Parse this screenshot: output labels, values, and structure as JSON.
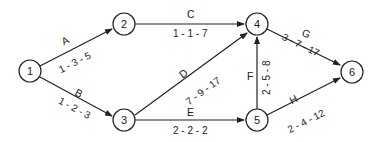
{
  "diagram": {
    "type": "PERT activity-on-arrow network",
    "nodes": [
      {
        "id": "1",
        "label": "1",
        "x": 30,
        "y": 71
      },
      {
        "id": "2",
        "label": "2",
        "x": 124,
        "y": 24
      },
      {
        "id": "3",
        "label": "3",
        "x": 124,
        "y": 120
      },
      {
        "id": "4",
        "label": "4",
        "x": 257,
        "y": 24
      },
      {
        "id": "5",
        "label": "5",
        "x": 257,
        "y": 120
      },
      {
        "id": "6",
        "label": "6",
        "x": 352,
        "y": 72
      }
    ],
    "edges": [
      {
        "from": "1",
        "to": "2",
        "activity": "A",
        "estimate": "1 - 3 - 5"
      },
      {
        "from": "1",
        "to": "3",
        "activity": "B",
        "estimate": "1 - 2 - 3"
      },
      {
        "from": "2",
        "to": "4",
        "activity": "C",
        "estimate": "1 - 1 - 7"
      },
      {
        "from": "3",
        "to": "4",
        "activity": "D",
        "estimate": "7 - 9 - 17"
      },
      {
        "from": "3",
        "to": "5",
        "activity": "E",
        "estimate": "2 - 2 - 2"
      },
      {
        "from": "5",
        "to": "4",
        "activity": "F",
        "estimate": "2 - 5 - 8"
      },
      {
        "from": "4",
        "to": "6",
        "activity": "G",
        "estimate": "3 - 7 - 17"
      },
      {
        "from": "5",
        "to": "6",
        "activity": "H",
        "estimate": "2 - 4 - 12"
      }
    ]
  },
  "colors": {
    "stroke": "#222222",
    "background": "#ffffff"
  }
}
